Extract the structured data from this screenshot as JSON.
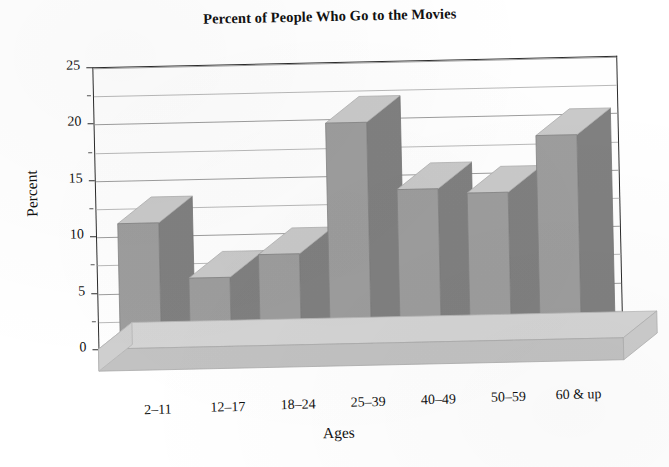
{
  "chart_data": {
    "type": "bar",
    "title": "Percent of People Who Go to the Movies",
    "xlabel": "Ages",
    "ylabel": "Percent",
    "categories": [
      "2–11",
      "12–17",
      "18–24",
      "25–39",
      "40–49",
      "50–59",
      "60 & up"
    ],
    "values": [
      13.5,
      8.5,
      10.5,
      22,
      16,
      15.5,
      20.5
    ],
    "ylim": [
      0,
      25
    ],
    "ytick_labels": [
      "0",
      "5",
      "10",
      "15",
      "20",
      "25"
    ],
    "ytick_values": [
      0,
      5,
      10,
      15,
      20,
      25
    ],
    "minor_gridline_values": [
      2.5,
      7.5,
      12.5,
      17.5,
      22.5
    ],
    "grid": true,
    "legend": "none",
    "style": "3d-column",
    "series": [
      {
        "name": "Percent",
        "values": [
          13.5,
          8.5,
          10.5,
          22,
          16,
          15.5,
          20.5
        ]
      }
    ]
  },
  "colors": {
    "bar_front": "#9d9d9d",
    "bar_top": "#c9c9c9",
    "bar_side": "#808080",
    "floor_top": "#d2d2d2",
    "floor_front": "#bfbfbf",
    "axis": "#2b2b2b",
    "gridline": "#9d9d9d",
    "background": "#ffffff",
    "text": "#111111"
  }
}
